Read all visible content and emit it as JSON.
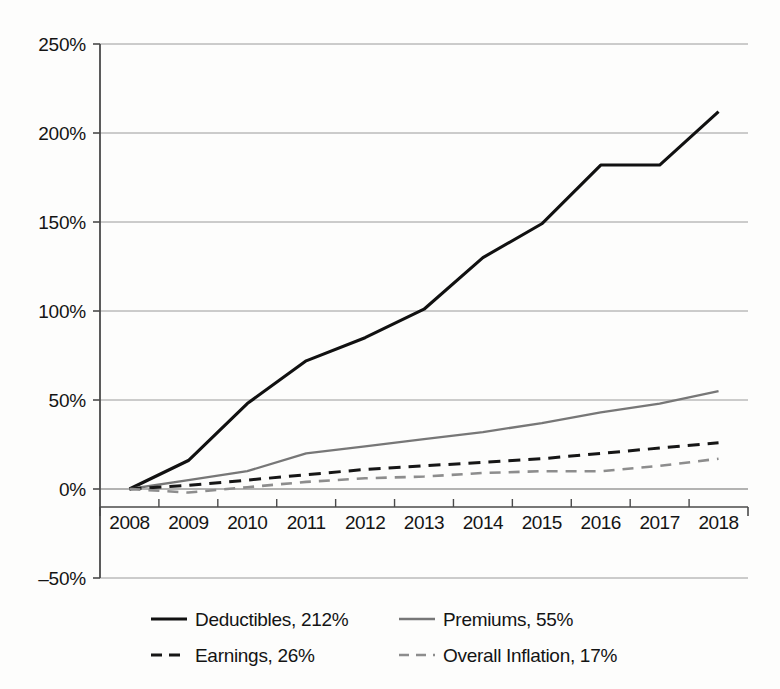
{
  "chart_data": {
    "type": "line",
    "title": "",
    "subtitle": "",
    "xlabel": "",
    "ylabel": "",
    "x": [
      2008,
      2009,
      2010,
      2011,
      2012,
      2013,
      2014,
      2015,
      2016,
      2017,
      2018
    ],
    "xtick_labels": [
      "2008",
      "2009",
      "2010",
      "2011",
      "2012",
      "2013",
      "2014",
      "2015",
      "2016",
      "2017",
      "2018"
    ],
    "ytick_labels": [
      "250%",
      "200%",
      "150%",
      "100%",
      "50%",
      "0%",
      "‒50%"
    ],
    "ytick_values": [
      250,
      200,
      150,
      100,
      50,
      0,
      -50
    ],
    "ylim": [
      -50,
      250
    ],
    "grid": true,
    "grid_axis": "y",
    "legend_position": "bottom",
    "legend_columns": 2,
    "series": [
      {
        "name": "Deductibles",
        "legend_label": "Deductibles, 212%",
        "end_value": 212,
        "color": "#111111",
        "style": "solid",
        "width": 3.1,
        "values": [
          0,
          16,
          48,
          72,
          85,
          101,
          130,
          149,
          182,
          182,
          212
        ]
      },
      {
        "name": "Premiums",
        "legend_label": "Premiums, 55%",
        "end_value": 55,
        "color": "#777777",
        "style": "solid",
        "width": 2.3,
        "values": [
          0,
          5,
          10,
          20,
          24,
          28,
          32,
          37,
          43,
          48,
          55
        ]
      },
      {
        "name": "Earnings",
        "legend_label": "Earnings, 26%",
        "end_value": 26,
        "color": "#161616",
        "style": "dashed",
        "width": 3.0,
        "values": [
          0,
          2,
          5,
          8,
          11,
          13,
          15,
          17,
          20,
          23,
          26
        ]
      },
      {
        "name": "Overall Inflation",
        "legend_label": "Overall Inflation, 17%",
        "end_value": 17,
        "color": "#8d8d8d",
        "style": "dashed",
        "width": 2.6,
        "values": [
          0,
          -2,
          1,
          4,
          6,
          7,
          9,
          10,
          10,
          13,
          17
        ]
      }
    ]
  },
  "axis": {
    "yticks": [
      {
        "label": "250%",
        "value": 250
      },
      {
        "label": "200%",
        "value": 200
      },
      {
        "label": "150%",
        "value": 150
      },
      {
        "label": "100%",
        "value": 100
      },
      {
        "label": "50%",
        "value": 50
      },
      {
        "label": "0%",
        "value": 0
      },
      {
        "label": "‒50%",
        "value": -50
      }
    ],
    "xticks": [
      {
        "label": "2008"
      },
      {
        "label": "2009"
      },
      {
        "label": "2010"
      },
      {
        "label": "2011"
      },
      {
        "label": "2012"
      },
      {
        "label": "2013"
      },
      {
        "label": "2014"
      },
      {
        "label": "2015"
      },
      {
        "label": "2016"
      },
      {
        "label": "2017"
      },
      {
        "label": "2018"
      }
    ]
  },
  "legend": {
    "rows": [
      {
        "left": "Deductibles, 212%",
        "right": "Premiums, 55%"
      },
      {
        "left": "Earnings, 26%",
        "right": "Overall Inflation, 17%"
      }
    ]
  },
  "colors": {
    "deductibles": "#111111",
    "premiums": "#777777",
    "earnings": "#161616",
    "inflation": "#8d8d8d",
    "grid": "#9a9a9a",
    "axis": "#4a4a4a",
    "background": "#fdfdfc"
  }
}
